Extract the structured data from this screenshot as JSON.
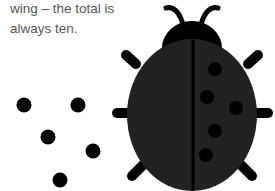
{
  "caption": {
    "line1": "wing – the total is",
    "line2": "always ten."
  },
  "colors": {
    "body": "#222222",
    "ink": "#000000",
    "text": "#555555"
  },
  "illustration": {
    "subject": "ladybug",
    "right_wing_spots": 5,
    "loose_spots": 5
  }
}
